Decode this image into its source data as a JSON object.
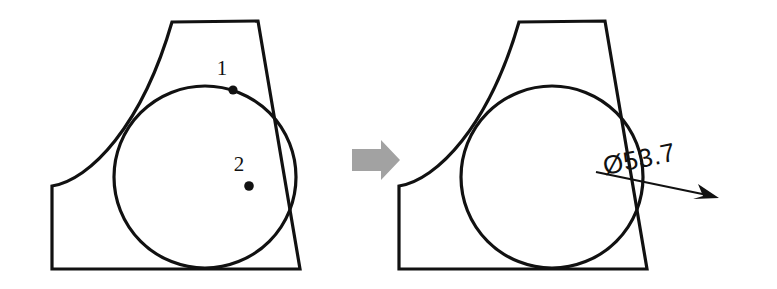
{
  "figure": {
    "background_color": "#ffffff",
    "line_color": "#111111",
    "arrow_color": "#a2a2a2",
    "width": 777,
    "height": 289
  },
  "left_panel": {
    "name": "input-part-with-selected-points",
    "caption": "",
    "markers": [
      {
        "label": "1",
        "label_x": 222,
        "label_y": 75,
        "dot_x": 233,
        "dot_y": 90,
        "dot_r": 4.6,
        "description": "point on circle edge"
      },
      {
        "label": "2",
        "label_x": 239,
        "label_y": 171,
        "dot_x": 249,
        "dot_y": 186,
        "dot_r": 4.8,
        "description": "point inside circular face"
      }
    ],
    "circle": {
      "cx": 205,
      "cy": 177,
      "r": 91
    },
    "outline_path": "M 172 22 L 258 21 L 300 269 L 52 269 L 52 186 C 90 180 142 126 172 22 Z"
  },
  "transform_arrow": {
    "name": "transform-arrow",
    "direction": "right",
    "x": 352,
    "y": 140,
    "width": 48,
    "height": 40,
    "color": "#a2a2a2",
    "points": "352,149 381,149 381,140 400,160 381,180 381,171 352,171"
  },
  "right_panel": {
    "name": "output-part-with-diameter-dimension",
    "caption": "",
    "circle": {
      "cx": 552,
      "cy": 177,
      "r": 91
    },
    "outline_path": "M 519 22 L 605 21 L 647 269 L 399 269 L 399 186 C 437 180 489 126 519 22 Z",
    "dimension": {
      "symbol": "Ø",
      "value": "53.7",
      "text": "Ø53.7",
      "text_x": 605,
      "text_y": 175,
      "rotation_deg": -11.5,
      "leader_start_x": 596,
      "leader_start_y": 172,
      "leader_end_x": 712,
      "leader_end_y": 196,
      "arrow_tip_x": 717,
      "arrow_tip_y": 197
    }
  }
}
